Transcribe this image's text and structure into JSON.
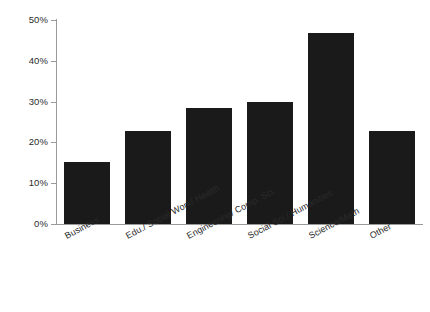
{
  "chart_data": {
    "type": "bar",
    "title": "",
    "subtitle": "",
    "xlabel": "",
    "ylabel": "",
    "categories": [
      "Business",
      "Edu./ Social Work/ Health",
      "Engineering/ Comp. Sci.",
      "Social Sci./ Humanities",
      "Science/Math",
      "Other"
    ],
    "values": [
      15.2,
      22.8,
      28.4,
      29.8,
      46.7,
      22.8
    ],
    "ylim": [
      0,
      50
    ],
    "yticks": [
      0,
      10,
      20,
      30,
      40,
      50
    ],
    "ytick_labels": [
      "0%",
      "10%",
      "20%",
      "30%",
      "40%",
      "50%"
    ],
    "grid": false,
    "legend": null,
    "bar_color": "#1a1a1a",
    "axis_color": "#9a9a9a",
    "background": "#ffffff"
  }
}
